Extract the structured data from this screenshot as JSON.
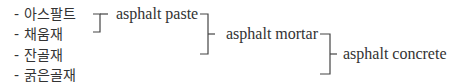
{
  "components": [
    {
      "label": "- 아스팔트"
    },
    {
      "label": "- 채움재"
    },
    {
      "label": "- 잔골재"
    },
    {
      "label": "- 굵은골재"
    }
  ],
  "stages": [
    {
      "label": "asphalt paste"
    },
    {
      "label": "asphalt mortar"
    },
    {
      "label": "asphalt concrete"
    }
  ],
  "colors": {
    "line": "#444444",
    "text": "#333333"
  }
}
